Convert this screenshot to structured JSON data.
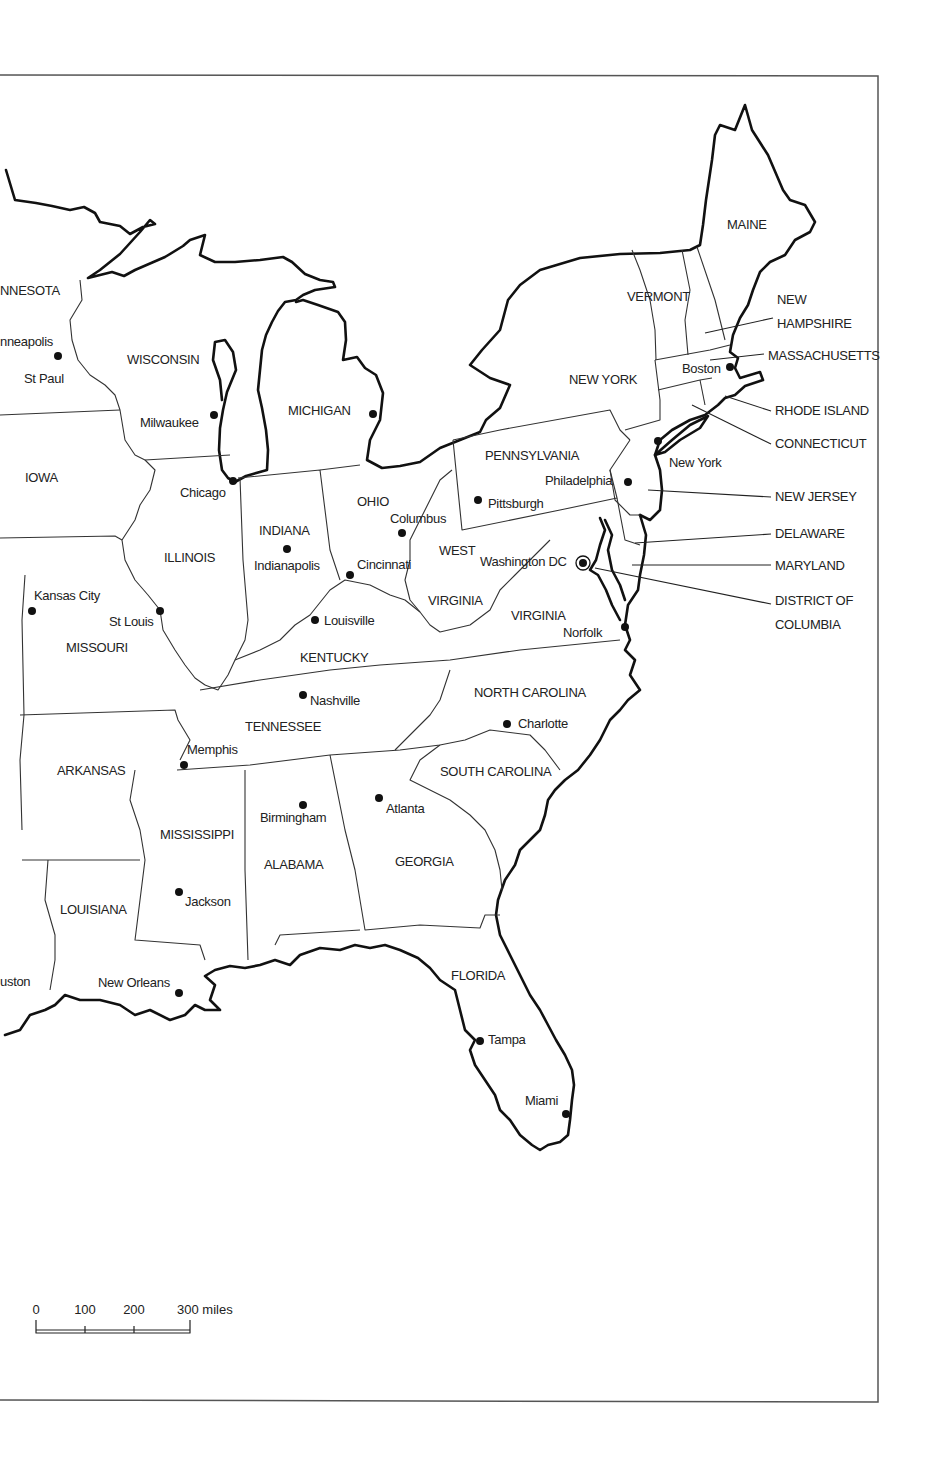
{
  "map": {
    "title": "Eastern United States",
    "states": [
      {
        "id": "minnesota",
        "label": "NNESOTA",
        "x": 0,
        "y": 295
      },
      {
        "id": "wisconsin",
        "label": "WISCONSIN",
        "x": 127,
        "y": 364
      },
      {
        "id": "michigan",
        "label": "MICHIGAN",
        "x": 288,
        "y": 415
      },
      {
        "id": "iowa",
        "label": "IOWA",
        "x": 25,
        "y": 482
      },
      {
        "id": "illinois",
        "label": "ILLINOIS",
        "x": 164,
        "y": 562
      },
      {
        "id": "indiana",
        "label": "INDIANA",
        "x": 259,
        "y": 535
      },
      {
        "id": "ohio",
        "label": "OHIO",
        "x": 357,
        "y": 506
      },
      {
        "id": "pennsylvania",
        "label": "PENNSYLVANIA",
        "x": 485,
        "y": 460
      },
      {
        "id": "new-york",
        "label": "NEW YORK",
        "x": 569,
        "y": 384
      },
      {
        "id": "vermont",
        "label": "VERMONT",
        "x": 627,
        "y": 301
      },
      {
        "id": "maine",
        "label": "MAINE",
        "x": 727,
        "y": 229
      },
      {
        "id": "west-virginia-1",
        "label": "WEST",
        "x": 439,
        "y": 555
      },
      {
        "id": "west-virginia-2",
        "label": "VIRGINIA",
        "x": 428,
        "y": 605
      },
      {
        "id": "virginia",
        "label": "VIRGINIA",
        "x": 511,
        "y": 620
      },
      {
        "id": "kentucky",
        "label": "KENTUCKY",
        "x": 300,
        "y": 662
      },
      {
        "id": "missouri",
        "label": "MISSOURI",
        "x": 66,
        "y": 652
      },
      {
        "id": "tennessee",
        "label": "TENNESSEE",
        "x": 245,
        "y": 731
      },
      {
        "id": "north-carolina",
        "label": "NORTH CAROLINA",
        "x": 474,
        "y": 697
      },
      {
        "id": "south-carolina",
        "label": "SOUTH CAROLINA",
        "x": 440,
        "y": 776
      },
      {
        "id": "arkansas",
        "label": "ARKANSAS",
        "x": 57,
        "y": 775
      },
      {
        "id": "mississippi",
        "label": "MISSISSIPPI",
        "x": 160,
        "y": 839
      },
      {
        "id": "alabama",
        "label": "ALABAMA",
        "x": 264,
        "y": 869
      },
      {
        "id": "georgia",
        "label": "GEORGIA",
        "x": 395,
        "y": 866
      },
      {
        "id": "louisiana",
        "label": "LOUISIANA",
        "x": 60,
        "y": 914
      },
      {
        "id": "florida",
        "label": "FLORIDA",
        "x": 451,
        "y": 980
      }
    ],
    "callout_states": [
      {
        "id": "new-hampshire",
        "lines": [
          "NEW",
          "HAMPSHIRE"
        ],
        "x": 777,
        "y": 304,
        "line": [
          705,
          333,
          773,
          318
        ]
      },
      {
        "id": "massachusetts",
        "label": "MASSACHUSETTS",
        "x": 768,
        "y": 360,
        "line": [
          710,
          360,
          764,
          354
        ]
      },
      {
        "id": "rhode-island",
        "label": "RHODE ISLAND",
        "x": 775,
        "y": 415,
        "line": [
          725,
          396,
          771,
          411
        ]
      },
      {
        "id": "connecticut",
        "label": "CONNECTICUT",
        "x": 775,
        "y": 448,
        "line": [
          692,
          405,
          771,
          444
        ]
      },
      {
        "id": "new-jersey",
        "label": "NEW JERSEY",
        "x": 775,
        "y": 501,
        "line": [
          648,
          490,
          771,
          497
        ]
      },
      {
        "id": "delaware",
        "label": "DELAWARE",
        "x": 775,
        "y": 538,
        "line": [
          635,
          543,
          771,
          534
        ]
      },
      {
        "id": "maryland",
        "label": "MARYLAND",
        "x": 775,
        "y": 570,
        "line": [
          632,
          565,
          771,
          565
        ]
      },
      {
        "id": "district-of-columbia",
        "lines": [
          "DISTRICT OF",
          "COLUMBIA"
        ],
        "x": 775,
        "y": 605,
        "line": [
          595,
          568,
          771,
          604
        ]
      }
    ],
    "cities": [
      {
        "id": "minneapolis",
        "label": "nneapolis",
        "dot": [
          58,
          356
        ],
        "x": 0,
        "y": 346
      },
      {
        "id": "st-paul",
        "label": "St Paul",
        "dot": null,
        "x": 24,
        "y": 383
      },
      {
        "id": "milwaukee",
        "label": "Milwaukee",
        "dot": [
          214,
          415
        ],
        "x": 140,
        "y": 427
      },
      {
        "id": "detroit",
        "label": "",
        "dot": [
          373,
          414
        ],
        "x": 0,
        "y": 0
      },
      {
        "id": "chicago",
        "label": "Chicago",
        "dot": [
          233,
          481
        ],
        "x": 180,
        "y": 497
      },
      {
        "id": "indianapolis",
        "label": "Indianapolis",
        "dot": [
          287,
          549
        ],
        "x": 254,
        "y": 570
      },
      {
        "id": "columbus",
        "label": "Columbus",
        "dot": [
          402,
          533
        ],
        "x": 390,
        "y": 523
      },
      {
        "id": "cincinnati",
        "label": "Cincinnati",
        "dot": [
          350,
          575
        ],
        "x": 357,
        "y": 569
      },
      {
        "id": "pittsburgh",
        "label": "Pittsburgh",
        "dot": [
          478,
          500
        ],
        "x": 488,
        "y": 508
      },
      {
        "id": "philadelphia",
        "label": "Philadelphia",
        "dot": [
          628,
          482
        ],
        "x": 545,
        "y": 485
      },
      {
        "id": "new-york-city",
        "label": "New York",
        "dot": [
          658,
          441
        ],
        "x": 669,
        "y": 467
      },
      {
        "id": "boston",
        "label": "Boston",
        "dot": [
          730,
          367
        ],
        "x": 682,
        "y": 373
      },
      {
        "id": "washington-dc",
        "label": "Washington DC",
        "dot": [
          583,
          563
        ],
        "x": 480,
        "y": 566
      },
      {
        "id": "norfolk",
        "label": "Norfolk",
        "dot": [
          625,
          627
        ],
        "x": 563,
        "y": 637
      },
      {
        "id": "kansas-city",
        "label": "Kansas City",
        "dot": [
          32,
          611
        ],
        "x": 34,
        "y": 600
      },
      {
        "id": "st-louis",
        "label": "St Louis",
        "dot": [
          160,
          611
        ],
        "x": 109,
        "y": 626
      },
      {
        "id": "louisville",
        "label": "Louisville",
        "dot": [
          315,
          620
        ],
        "x": 324,
        "y": 625
      },
      {
        "id": "nashville",
        "label": "Nashville",
        "dot": [
          303,
          695
        ],
        "x": 310,
        "y": 705
      },
      {
        "id": "memphis",
        "label": "Memphis",
        "dot": [
          184,
          765
        ],
        "x": 187,
        "y": 754
      },
      {
        "id": "charlotte",
        "label": "Charlotte",
        "dot": [
          507,
          724
        ],
        "x": 518,
        "y": 728
      },
      {
        "id": "atlanta",
        "label": "Atlanta",
        "dot": [
          379,
          798
        ],
        "x": 386,
        "y": 813
      },
      {
        "id": "birmingham",
        "label": "Birmingham",
        "dot": [
          303,
          805
        ],
        "x": 260,
        "y": 822
      },
      {
        "id": "jackson",
        "label": "Jackson",
        "dot": [
          179,
          892
        ],
        "x": 185,
        "y": 906
      },
      {
        "id": "houston",
        "label": "uston",
        "dot": null,
        "x": 0,
        "y": 986
      },
      {
        "id": "new-orleans",
        "label": "New Orleans",
        "dot": [
          179,
          993
        ],
        "x": 98,
        "y": 987
      },
      {
        "id": "tampa",
        "label": "Tampa",
        "dot": [
          480,
          1041
        ],
        "x": 488,
        "y": 1044
      },
      {
        "id": "miami",
        "label": "Miami",
        "dot": [
          566,
          1114
        ],
        "x": 525,
        "y": 1105
      }
    ],
    "scale_bar": {
      "ticks": [
        {
          "label": "0",
          "x": 36
        },
        {
          "label": "100",
          "x": 85
        },
        {
          "label": "200",
          "x": 134
        },
        {
          "label": "300 miles",
          "x": 190
        }
      ],
      "unit": "miles"
    }
  },
  "colors": {
    "background": "#ffffff",
    "ink": "#111111",
    "frame": "#555555"
  }
}
